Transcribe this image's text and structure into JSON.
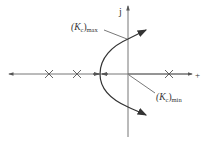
{
  "diagram": {
    "axes": {
      "imag_axis_label": "j",
      "real_axis_label": "+"
    },
    "labels": {
      "kc_max": {
        "base": "(K",
        "sub1": "c",
        "close": ")",
        "sub2": "max"
      },
      "kc_min": {
        "base": "(K",
        "sub1": "c",
        "close": ")",
        "sub2": "min"
      }
    },
    "poles": [
      {
        "name": "pole-left-1",
        "marker": "x"
      },
      {
        "name": "pole-left-2",
        "marker": "x"
      },
      {
        "name": "pole-right",
        "marker": "x"
      }
    ],
    "colors": {
      "line": "#555555",
      "curve": "#333333"
    }
  }
}
